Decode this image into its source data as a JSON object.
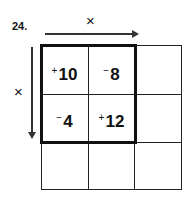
{
  "problem": {
    "number": "24.",
    "operation_top": "×",
    "operation_left": "×",
    "grid": {
      "rows": 3,
      "cols": 3,
      "cells": [
        [
          {
            "sign": "+",
            "value": "10"
          },
          {
            "sign": "−",
            "value": "8"
          },
          {
            "sign": "",
            "value": ""
          }
        ],
        [
          {
            "sign": "−",
            "value": "4"
          },
          {
            "sign": "+",
            "value": "12"
          },
          {
            "sign": "",
            "value": ""
          }
        ],
        [
          {
            "sign": "",
            "value": ""
          },
          {
            "sign": "",
            "value": ""
          },
          {
            "sign": "",
            "value": ""
          }
        ]
      ]
    }
  }
}
